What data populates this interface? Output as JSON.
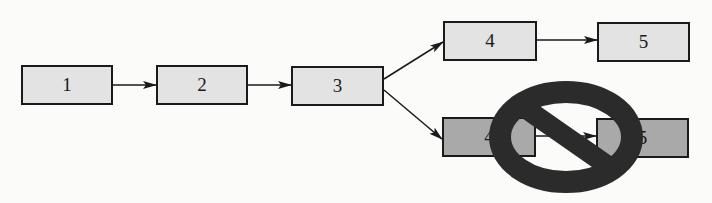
{
  "diagram": {
    "type": "flowchart",
    "colors": {
      "box_fill_allowed": "#e3e3e3",
      "box_fill_blocked": "#a9a9a9",
      "stroke": "#1a1a1a",
      "prohibition_sign": "#2b2b2b"
    },
    "nodes": [
      {
        "id": "n1",
        "label": "1",
        "path": "main"
      },
      {
        "id": "n2",
        "label": "2",
        "path": "main"
      },
      {
        "id": "n3",
        "label": "3",
        "path": "main"
      },
      {
        "id": "n4a",
        "label": "4",
        "path": "upper-allowed"
      },
      {
        "id": "n5a",
        "label": "5",
        "path": "upper-allowed"
      },
      {
        "id": "n4b",
        "label": "4",
        "path": "lower-blocked"
      },
      {
        "id": "n5b",
        "label": "5",
        "path": "lower-blocked"
      }
    ],
    "edges": [
      {
        "from": "n1",
        "to": "n2"
      },
      {
        "from": "n2",
        "to": "n3"
      },
      {
        "from": "n3",
        "to": "n4a"
      },
      {
        "from": "n4a",
        "to": "n5a"
      },
      {
        "from": "n3",
        "to": "n4b"
      },
      {
        "from": "n4b",
        "to": "n5b"
      }
    ],
    "overlay": {
      "symbol": "prohibition-sign",
      "applies_to": [
        "n4b",
        "n5b"
      ]
    }
  }
}
